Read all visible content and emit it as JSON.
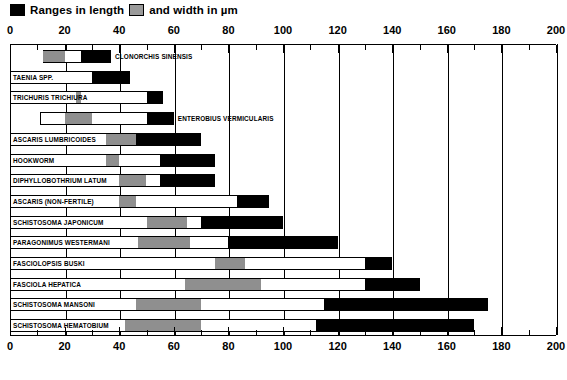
{
  "legend": {
    "length_label": "Ranges in length",
    "width_label": "and width in µm",
    "length_swatch": "black-swatch",
    "width_swatch": "gray-swatch",
    "length_color": "#000000",
    "width_color": "#8f8f8f"
  },
  "axis": {
    "min": 0,
    "max": 200,
    "major_step": 20,
    "minor_step": 10,
    "tick_labels": [
      "0",
      "20",
      "40",
      "60",
      "80",
      "100",
      "120",
      "140",
      "160",
      "180",
      "200"
    ]
  },
  "chart_data": {
    "type": "bar",
    "title": "",
    "subtitle": "",
    "xlabel": "",
    "ylabel": "",
    "xlim": [
      0,
      200
    ],
    "grid": true,
    "grid_axis": "x",
    "legend_position": "top-left",
    "orientation": "horizontal",
    "units": "µm",
    "series": [
      {
        "name": "Ranges in length",
        "color": "#000000"
      },
      {
        "name": "and width in µm",
        "color": "#8f8f8f"
      }
    ],
    "categories": [
      "CLONORCHIS SINENSIS",
      "TAENIA SPP.",
      "TRICHURIS TRICHIURA",
      "ENTEROBIUS VERMICULARIS",
      "ASCARIS LUMBRICOIDES",
      "HOOKWORM",
      "DIPHYLLOBOTHRIUM LATUM",
      "ASCARIS (NON-FERTILE)",
      "SCHISTOSOMA JAPONICUM",
      "PARAGONIMUS WESTERMANI",
      "FASCIOLOPSIS BUSKI",
      "FASCIOLA HEPATICA",
      "SCHISTOSOMA MANSONI",
      "SCHISTOSOMA HEMATOBIUM"
    ],
    "rows": [
      {
        "label": "CLONORCHIS SINENSIS",
        "label_pos": "outside",
        "box": [
          12,
          37
        ],
        "width_range": [
          12,
          20
        ],
        "length_range": [
          26,
          37
        ]
      },
      {
        "label": "TAENIA SPP.",
        "label_pos": "inside",
        "box": [
          0,
          44
        ],
        "width_range": null,
        "length_range": [
          30,
          44
        ]
      },
      {
        "label": "TRICHURIS TRICHIURA",
        "label_pos": "inside",
        "box": [
          0,
          56
        ],
        "width_range": [
          24,
          26
        ],
        "length_range": [
          50,
          56
        ]
      },
      {
        "label": "ENTEROBIUS VERMICULARIS",
        "label_pos": "outside",
        "box": [
          11,
          60
        ],
        "width_range": [
          20,
          30
        ],
        "length_range": [
          50,
          60
        ]
      },
      {
        "label": "ASCARIS LUMBRICOIDES",
        "label_pos": "inside",
        "box": [
          0,
          70
        ],
        "width_range": [
          35,
          46
        ],
        "length_range": [
          46,
          70
        ]
      },
      {
        "label": "HOOKWORM",
        "label_pos": "inside",
        "box": [
          0,
          75
        ],
        "width_range": [
          35,
          40
        ],
        "length_range": [
          55,
          75
        ]
      },
      {
        "label": "DIPHYLLOBOTHRIUM LATUM",
        "label_pos": "inside",
        "box": [
          0,
          75
        ],
        "width_range": [
          40,
          50
        ],
        "length_range": [
          55,
          75
        ]
      },
      {
        "label": "ASCARIS (NON-FERTILE)",
        "label_pos": "inside",
        "box": [
          0,
          95
        ],
        "width_range": [
          40,
          46
        ],
        "length_range": [
          83,
          95
        ]
      },
      {
        "label": "SCHISTOSOMA JAPONICUM",
        "label_pos": "inside",
        "box": [
          0,
          100
        ],
        "width_range": [
          50,
          65
        ],
        "length_range": [
          70,
          100
        ]
      },
      {
        "label": "PARAGONIMUS WESTERMANI",
        "label_pos": "inside",
        "box": [
          0,
          120
        ],
        "width_range": [
          47,
          66
        ],
        "length_range": [
          80,
          120
        ]
      },
      {
        "label": "FASCIOLOPSIS BUSKI",
        "label_pos": "inside",
        "box": [
          0,
          140
        ],
        "width_range": [
          75,
          86
        ],
        "length_range": [
          130,
          140
        ]
      },
      {
        "label": "FASCIOLA HEPATICA",
        "label_pos": "inside",
        "box": [
          0,
          150
        ],
        "width_range": [
          64,
          92
        ],
        "length_range": [
          130,
          150
        ]
      },
      {
        "label": "SCHISTOSOMA MANSONI",
        "label_pos": "inside",
        "box": [
          0,
          175
        ],
        "width_range": [
          46,
          70
        ],
        "length_range": [
          115,
          175
        ]
      },
      {
        "label": "SCHISTOSOMA HEMATOBIUM",
        "label_pos": "inside",
        "box": [
          0,
          170
        ],
        "width_range": [
          42,
          70
        ],
        "length_range": [
          112,
          170
        ]
      }
    ]
  }
}
